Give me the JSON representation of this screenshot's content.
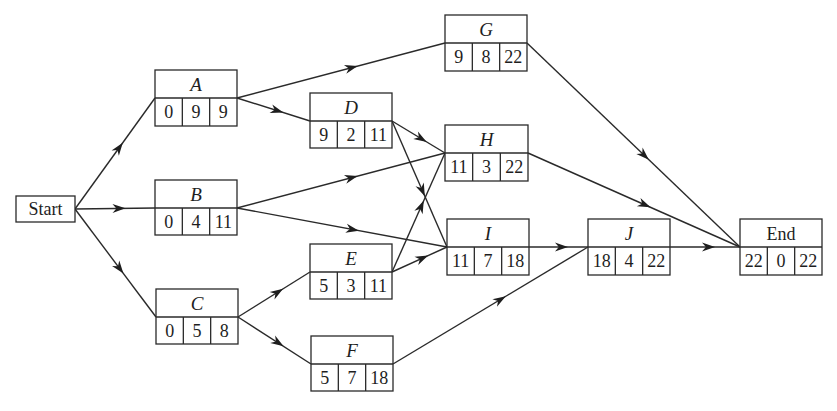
{
  "diagram": {
    "type": "activity-on-node network (critical path)",
    "node_fields": [
      "earliest_start",
      "duration",
      "latest_finish"
    ],
    "colors": {
      "stroke": "#2a2a2a",
      "text": "#1e1e1e",
      "background": "#ffffff"
    },
    "start": {
      "id": "Start",
      "label": "Start",
      "x": 16,
      "y": 196,
      "w": 59,
      "h": 26
    },
    "nodes": [
      {
        "id": "A",
        "label": "A",
        "italic": true,
        "x": 155,
        "y": 70,
        "w": 82,
        "h": 56,
        "values": [
          "0",
          "9",
          "9"
        ]
      },
      {
        "id": "B",
        "label": "B",
        "italic": true,
        "x": 155,
        "y": 180,
        "w": 82,
        "h": 55,
        "values": [
          "0",
          "4",
          "11"
        ]
      },
      {
        "id": "C",
        "label": "C",
        "italic": true,
        "x": 156,
        "y": 289,
        "w": 82,
        "h": 55,
        "values": [
          "0",
          "5",
          "8"
        ]
      },
      {
        "id": "D",
        "label": "D",
        "italic": true,
        "x": 310,
        "y": 93,
        "w": 82,
        "h": 55,
        "values": [
          "9",
          "2",
          "11"
        ]
      },
      {
        "id": "E",
        "label": "E",
        "italic": true,
        "x": 310,
        "y": 244,
        "w": 82,
        "h": 55,
        "values": [
          "5",
          "3",
          "11"
        ]
      },
      {
        "id": "F",
        "label": "F",
        "italic": true,
        "x": 311,
        "y": 336,
        "w": 82,
        "h": 55,
        "values": [
          "5",
          "7",
          "18"
        ]
      },
      {
        "id": "G",
        "label": "G",
        "italic": true,
        "x": 445,
        "y": 15,
        "w": 82,
        "h": 56,
        "values": [
          "9",
          "8",
          "22"
        ]
      },
      {
        "id": "H",
        "label": "H",
        "italic": true,
        "x": 445,
        "y": 125,
        "w": 83,
        "h": 56,
        "values": [
          "11",
          "3",
          "22"
        ]
      },
      {
        "id": "I",
        "label": "I",
        "italic": true,
        "x": 447,
        "y": 219,
        "w": 82,
        "h": 56,
        "values": [
          "11",
          "7",
          "18"
        ]
      },
      {
        "id": "J",
        "label": "J",
        "italic": true,
        "x": 588,
        "y": 219,
        "w": 82,
        "h": 56,
        "values": [
          "18",
          "4",
          "22"
        ]
      },
      {
        "id": "End",
        "label": "End",
        "italic": false,
        "x": 740,
        "y": 219,
        "w": 82,
        "h": 56,
        "values": [
          "22",
          "0",
          "22"
        ]
      }
    ],
    "edges": [
      {
        "from": "Start",
        "to": "A"
      },
      {
        "from": "Start",
        "to": "B"
      },
      {
        "from": "Start",
        "to": "C"
      },
      {
        "from": "A",
        "to": "G"
      },
      {
        "from": "A",
        "to": "D"
      },
      {
        "from": "B",
        "to": "H"
      },
      {
        "from": "B",
        "to": "I"
      },
      {
        "from": "C",
        "to": "E"
      },
      {
        "from": "C",
        "to": "F"
      },
      {
        "from": "D",
        "to": "H"
      },
      {
        "from": "D",
        "to": "I"
      },
      {
        "from": "E",
        "to": "H"
      },
      {
        "from": "E",
        "to": "I"
      },
      {
        "from": "F",
        "to": "J"
      },
      {
        "from": "G",
        "to": "End"
      },
      {
        "from": "H",
        "to": "End"
      },
      {
        "from": "I",
        "to": "J"
      },
      {
        "from": "J",
        "to": "End"
      }
    ]
  }
}
